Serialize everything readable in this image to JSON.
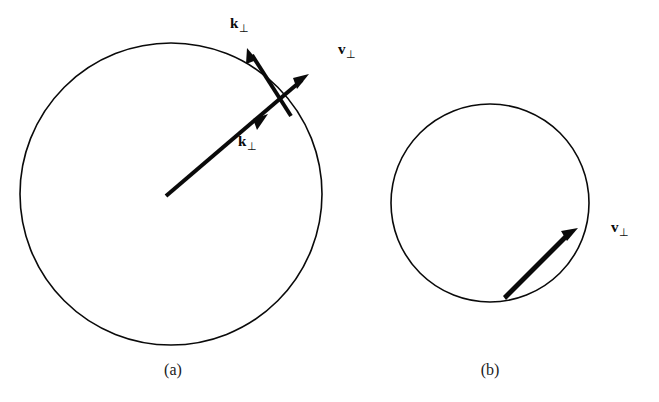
{
  "figure": {
    "background_color": "#ffffff",
    "ink_color": "#0a0a0a",
    "width": 659,
    "height": 402
  },
  "panels": [
    {
      "id": "a",
      "caption": "(a)",
      "caption_x": 173,
      "caption_y": 361,
      "circle": {
        "cx": 171,
        "cy": 194,
        "r": 151,
        "stroke_width": 1.6
      },
      "labels": [
        {
          "name": "k-perp-tangential-label",
          "symbol": "k",
          "subscript": "⊥",
          "x": 230,
          "y": 16
        },
        {
          "name": "v-perp-label",
          "symbol": "v",
          "subscript": "⊥",
          "x": 338,
          "y": 42
        },
        {
          "name": "k-perp-radial-label",
          "symbol": "k",
          "subscript": "⊥",
          "x": 238,
          "y": 134
        }
      ],
      "arrows": [
        {
          "name": "k-perp-radial-arrow",
          "x1": 166,
          "y1": 196,
          "x2": 309,
          "y2": 74,
          "head_at_tip": true,
          "mid_head_t": 0.67,
          "width": 4.0
        },
        {
          "name": "k-perp-tangential-arrow",
          "x1": 291,
          "y1": 116,
          "x2": 248,
          "y2": 49,
          "head_at_tip": true,
          "mid_head_t": null,
          "width": 4.0
        }
      ]
    },
    {
      "id": "b",
      "caption": "(b)",
      "caption_x": 490,
      "caption_y": 361,
      "circle": {
        "cx": 490,
        "cy": 203,
        "r": 99,
        "stroke_width": 1.6
      },
      "labels": [
        {
          "name": "v-perp-label",
          "symbol": "v",
          "subscript": "⊥",
          "x": 611,
          "y": 220
        },
        null,
        null
      ],
      "arrows": [
        {
          "name": "v-perp-tangent-arrow",
          "x1": 508,
          "y1": 299,
          "x2": 578,
          "y2": 228,
          "head_at_tip": true,
          "mid_head_t": null,
          "width": 4.2
        }
      ]
    }
  ]
}
